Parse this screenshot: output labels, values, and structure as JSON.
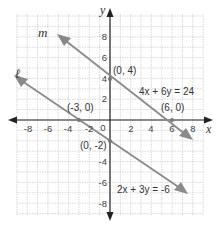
{
  "chart_data": {
    "type": "line",
    "title": "",
    "xlabel": "x",
    "ylabel": "y",
    "xlim": [
      -9,
      9
    ],
    "ylim": [
      -9,
      10
    ],
    "grid": true,
    "x_ticks": [
      "-8",
      "-6",
      "-4",
      "-2",
      "0",
      "2",
      "4",
      "6",
      "8"
    ],
    "y_ticks": [
      "8",
      "6",
      "4",
      "2",
      "-4",
      "-6",
      "-8"
    ],
    "origin_label": "0",
    "series": [
      {
        "name": "m",
        "equation": "4x + 6y = 24",
        "points": [
          [
            -5,
            7.33
          ],
          [
            0,
            4
          ],
          [
            6,
            0
          ],
          [
            8,
            -1.33
          ]
        ],
        "labeled_points": [
          {
            "label": "(0, 4)",
            "x": 0,
            "y": 4
          },
          {
            "label": "(6, 0)",
            "x": 6,
            "y": 0
          }
        ]
      },
      {
        "name": "ℓ",
        "equation": "2x + 3y = -6",
        "points": [
          [
            -9.5,
            4.33
          ],
          [
            -3,
            0
          ],
          [
            0,
            -2
          ],
          [
            7.5,
            -7
          ]
        ],
        "labeled_points": [
          {
            "label": "(-3, 0)",
            "x": -3,
            "y": 0
          },
          {
            "label": "(0, -2)",
            "x": 0,
            "y": -2
          }
        ]
      }
    ]
  },
  "labels": {
    "line_m_name": "m",
    "line_l_name": "ℓ",
    "eq_m": "4x + 6y = 24",
    "eq_l": "2x + 3y = -6",
    "pt_0_4": "(0, 4)",
    "pt_6_0": "(6, 0)",
    "pt_m3_0": "(-3, 0)",
    "pt_0_m2": "(0, -2)",
    "x_axis": "x",
    "y_axis": "y",
    "origin": "0",
    "xt": [
      "-8",
      "-6",
      "-4",
      "-2",
      "2",
      "4",
      "6",
      "8"
    ],
    "yt": [
      "8",
      "6",
      "4",
      "2",
      "-4",
      "-6",
      "-8"
    ]
  },
  "colors": {
    "grid": "#c8c8c8",
    "axis": "#222222",
    "line": "#8a8a8a"
  }
}
